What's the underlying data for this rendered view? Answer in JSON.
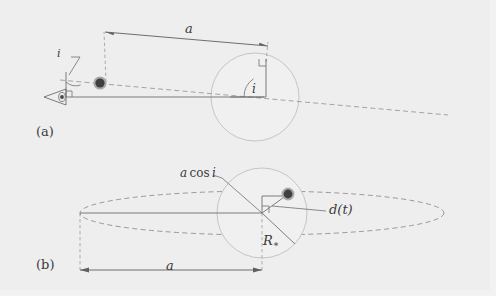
{
  "figure": {
    "background_color": "#eeeeee",
    "line_color": "#6e6e6e",
    "dash_color": "#8a8a8a",
    "star_fill": "#efefef",
    "star_stroke": "#b9b9b9",
    "planet_fill": "#4a4a4a",
    "planet_ring": "#9a9a9a",
    "text_color": "#3a3a3a",
    "width": 496,
    "height": 296
  },
  "panels": [
    {
      "id": "a",
      "tag": "(a)",
      "description": "edge-on view of orbit with inclination angle i",
      "labels": {
        "semimajor_axis": "a",
        "inclination_near_observer": "i",
        "inclination_at_star": "i"
      },
      "elements": {
        "observer_icon": "eye-icon",
        "planet_icon": "planet-dot",
        "star_icon": "star-disk",
        "sight_line": "line-of-sight-dashed",
        "right_angle_marker": "right-angle-marker"
      }
    },
    {
      "id": "b",
      "tag": "(b)",
      "description": "sky-projected view of inclined orbit ellipse with projected separation",
      "labels": {
        "projected_axis": "a cos i",
        "projected_axis_parts": {
          "a": "a",
          "cos": "cos",
          "i": "i"
        },
        "separation": "d(t)",
        "stellar_radius": "R",
        "stellar_radius_sub": "∗",
        "semimajor_axis": "a"
      },
      "elements": {
        "orbit_ellipse": "orbit-ellipse-dashed",
        "star_icon": "star-disk",
        "planet_icon": "planet-dot",
        "right_angle_marker": "right-angle-marker",
        "radius_line": "stellar-radius-line"
      }
    }
  ]
}
